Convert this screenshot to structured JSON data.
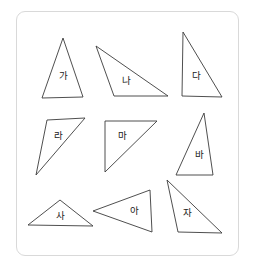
{
  "worksheet": {
    "background_color": "#ffffff",
    "frame": {
      "border_color": "#d9d9d9",
      "fill_color": "#ffffff",
      "corner_radius": "9"
    },
    "shape_style": {
      "stroke_color": "#3b3b3b",
      "fill_color": "#ffffff",
      "label_color": "#222222"
    },
    "shapes": [
      {
        "id": "triangle-ga",
        "label": "가",
        "points": "63,38 83,97 42,98",
        "label_x": "63",
        "label_y": "76"
      },
      {
        "id": "triangle-na",
        "label": "나",
        "points": "96,46 168,96 114,96",
        "label_x": "126",
        "label_y": "81"
      },
      {
        "id": "triangle-da",
        "label": "다",
        "points": "183,32 222,97 182,96",
        "label_x": "196",
        "label_y": "76"
      },
      {
        "id": "triangle-ra",
        "label": "라",
        "points": "47,120 85,118 36,175",
        "label_x": "58",
        "label_y": "136"
      },
      {
        "id": "triangle-ma",
        "label": "마",
        "points": "105,121 157,121 105,172",
        "label_x": "122",
        "label_y": "136"
      },
      {
        "id": "triangle-ba",
        "label": "바",
        "points": "204,113 213,175 176,175",
        "label_x": "199",
        "label_y": "155"
      },
      {
        "id": "triangle-sa",
        "label": "사",
        "points": "60,200 93,226 28,225",
        "label_x": "60",
        "label_y": "216"
      },
      {
        "id": "triangle-a",
        "label": "아",
        "points": "150,190 152,232 93,211",
        "label_x": "134",
        "label_y": "211"
      },
      {
        "id": "triangle-ja",
        "label": "자",
        "points": "167,180 222,233 178,232",
        "label_x": "187",
        "label_y": "213"
      }
    ]
  }
}
